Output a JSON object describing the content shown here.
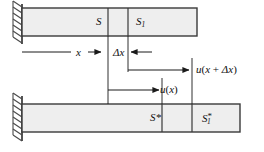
{
  "figure": {
    "colors": {
      "bar_fill": "#eeeeee",
      "bar_stroke": "#3a3a3a",
      "line": "#1a1a1a",
      "hatch": "#555555",
      "background": "#ffffff"
    },
    "top_bar": {
      "name": "undeformed-bar",
      "x": 22,
      "y": 8,
      "width": 175,
      "height": 28,
      "dividers": [
        108,
        128
      ],
      "segments": [
        {
          "label": "S",
          "label_html": "S"
        },
        {
          "label": "S1",
          "label_html": "S<sub>1</sub>"
        }
      ]
    },
    "bottom_bar": {
      "name": "deformed-bar",
      "x": 22,
      "y": 104,
      "width": 218,
      "height": 28,
      "dividers": [
        162,
        192
      ],
      "segments": [
        {
          "label": "S*",
          "label_html": "S*"
        },
        {
          "label": "S1*",
          "label_html": "S<sub>1</sub><sup>*</sup>"
        }
      ]
    },
    "walls": [
      {
        "name": "top-wall",
        "x": 22,
        "y_top": 4,
        "y_bottom": 44
      },
      {
        "name": "bottom-wall",
        "x": 22,
        "y_top": 96,
        "y_bottom": 140
      }
    ],
    "guides": [
      {
        "name": "guide-x-at-S",
        "x": 108,
        "y1": 36,
        "y2": 104
      },
      {
        "name": "guide-x-plus-dx",
        "x": 128,
        "y1": 36,
        "y2": 70
      },
      {
        "name": "guide-u-x-end",
        "x": 162,
        "y1": 78,
        "y2": 104
      },
      {
        "name": "guide-u-x-dx-end",
        "x": 192,
        "y1": 58,
        "y2": 104
      }
    ],
    "dimensions": [
      {
        "name": "dimension-x",
        "label": "x",
        "y": 52,
        "from": 22,
        "to": 108,
        "arrow": "right"
      },
      {
        "name": "dimension-delta-x",
        "label": "Δx",
        "y": 52,
        "from": 128,
        "to": 152,
        "arrow": "left"
      },
      {
        "name": "dimension-u-x-plus-delta-x",
        "label": "u(x + Δx)",
        "y": 70,
        "from": 128,
        "to": 192,
        "arrow": "right"
      },
      {
        "name": "dimension-u-x",
        "label": "u(x)",
        "y": 90,
        "from": 108,
        "to": 162,
        "arrow": "right"
      }
    ],
    "labels": {
      "S": "S",
      "S_sub": "1",
      "S_star": "S*",
      "x": "x",
      "delta": "Δ",
      "u": "u",
      "paren_open": "(",
      "paren_close": ")",
      "plus": " + ",
      "star": "*"
    }
  }
}
